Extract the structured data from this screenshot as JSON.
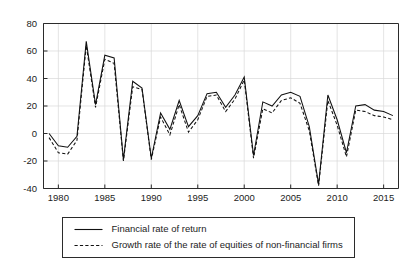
{
  "chart_data": {
    "type": "line",
    "title": "",
    "subtitle": "",
    "xlabel": "",
    "ylabel": "",
    "xlim": [
      1978.4,
      2016.6
    ],
    "ylim": [
      -40,
      80
    ],
    "grid": true,
    "legend_position": "below-plot-center",
    "ytick_labels": [
      "80",
      "60",
      "40",
      "20",
      "0",
      "-20",
      "-40"
    ],
    "ytick_values": [
      80,
      60,
      40,
      20,
      0,
      -20,
      -40
    ],
    "xtick_labels": [
      "1980",
      "1985",
      "1990",
      "1995",
      "2000",
      "2005",
      "2010",
      "2015"
    ],
    "xtick_values": [
      1980,
      1985,
      1990,
      1995,
      2000,
      2005,
      2010,
      2015
    ],
    "x": [
      1979,
      1980,
      1981,
      1982,
      1983,
      1984,
      1985,
      1986,
      1987,
      1988,
      1989,
      1990,
      1991,
      1992,
      1993,
      1994,
      1995,
      1996,
      1997,
      1998,
      1999,
      2000,
      2001,
      2002,
      2003,
      2004,
      2005,
      2006,
      2007,
      2008,
      2009,
      2010,
      2011,
      2012,
      2013,
      2014,
      2015,
      2016
    ],
    "series": [
      {
        "name": "Financial rate of return",
        "style": "solid",
        "values": [
          0,
          -9,
          -10,
          -2,
          67,
          21,
          57,
          55,
          -19,
          38,
          33,
          -18,
          15,
          3,
          24,
          5,
          13,
          29,
          30,
          19,
          28,
          41,
          -16,
          23,
          20,
          28,
          30,
          27,
          5,
          -37,
          28,
          10,
          -14,
          20,
          21,
          17,
          16,
          13
        ]
      },
      {
        "name": "Growth rate of the rate of equities of non-financial firms",
        "style": "dashed",
        "values": [
          -3,
          -14,
          -15,
          -5,
          64,
          19,
          54,
          51,
          -20,
          34,
          32,
          -19,
          12,
          -1,
          21,
          1,
          10,
          27,
          28,
          16,
          25,
          39,
          -18,
          18,
          15,
          24,
          26,
          22,
          2,
          -38,
          24,
          6,
          -17,
          17,
          16,
          13,
          12,
          10
        ]
      }
    ]
  },
  "legend": {
    "items": [
      {
        "label": "Financial rate of return",
        "style": "solid"
      },
      {
        "label": "Growth rate of the rate of equities of non-financial firms",
        "style": "dashed"
      }
    ]
  },
  "colors": {
    "line": "#111111",
    "axis": "#2b2b2b",
    "grid": "#d8d8d8",
    "background": "#ffffff"
  }
}
